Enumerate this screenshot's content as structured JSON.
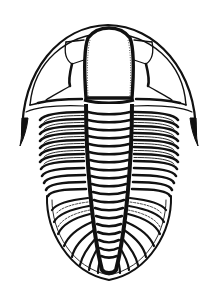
{
  "image": {
    "subject": "trilobite line drawing",
    "background_color": "#ffffff",
    "ink_color": "#111111",
    "parts": {
      "cephalon": "cephalon (head shield)",
      "glabella": "glabella",
      "eyes": "eye lobes",
      "genal_spines": "genal spines",
      "thorax": "thoracic segments",
      "axis": "axial lobe",
      "pygidium": "pygidium (tail shield)"
    },
    "thorax_segment_count": 12,
    "pygidium_rib_count": 9
  }
}
